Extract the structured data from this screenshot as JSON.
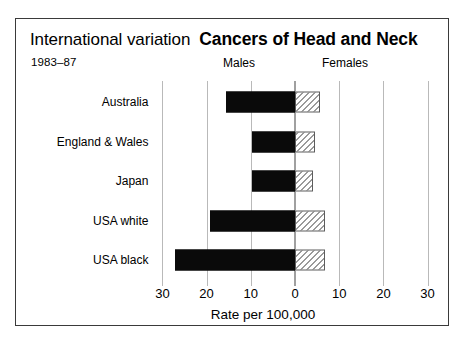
{
  "header": {
    "kicker": "International variation",
    "title": "Cancers of Head and Neck",
    "period": "1983–87",
    "males_label": "Males",
    "females_label": "Females"
  },
  "chart_data": {
    "type": "bar",
    "orientation": "horizontal",
    "style": "back-to-back population pyramid",
    "title": "Cancers of Head and Neck",
    "subtitle": "International variation",
    "period": "1983–87",
    "xlabel": "Rate per 100,000",
    "ylabel": "",
    "grid": true,
    "legend_position": "top (column headings)",
    "axis_ticks": [
      30,
      20,
      10,
      0,
      10,
      20,
      30
    ],
    "axis_tick_labels": [
      "30",
      "20",
      "10",
      "0",
      "10",
      "20",
      "30"
    ],
    "left_axis_range": [
      30,
      0
    ],
    "right_axis_range": [
      0,
      30
    ],
    "categories": [
      "Australia",
      "England & Wales",
      "Japan",
      "USA white",
      "USA black"
    ],
    "series": [
      {
        "name": "Males",
        "side": "left",
        "fill": "solid-black",
        "values": [
          15.5,
          9.8,
          9.7,
          19.2,
          27.2
        ]
      },
      {
        "name": "Females",
        "side": "right",
        "fill": "hatched",
        "values": [
          5.7,
          4.6,
          4.0,
          6.9,
          6.9
        ]
      }
    ]
  },
  "axis": {
    "title": "Rate per 100,000",
    "ticks": [
      {
        "label": "30",
        "value": -30
      },
      {
        "label": "20",
        "value": -20
      },
      {
        "label": "10",
        "value": -10
      },
      {
        "label": "0",
        "value": 0
      },
      {
        "label": "10",
        "value": 10
      },
      {
        "label": "20",
        "value": 20
      },
      {
        "label": "30",
        "value": 30
      }
    ]
  },
  "colors": {
    "male_bar": "#0a0a0a",
    "female_bar_outline": "#5d5d5d",
    "gridline": "#b9b9b9",
    "frame": "#3a3a3a",
    "background": "#ffffff"
  }
}
